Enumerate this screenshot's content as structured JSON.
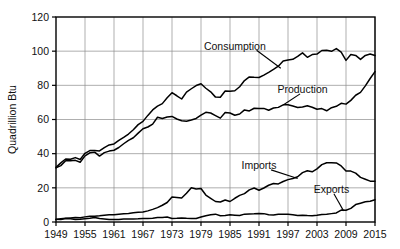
{
  "chart_data": {
    "type": "line",
    "title": "",
    "xlabel": "",
    "ylabel": "Quadrillion Btu",
    "xlim": [
      1949,
      2015
    ],
    "ylim": [
      0,
      120
    ],
    "grid": true,
    "legend_position": "inline-annotations",
    "xticks": [
      "1949",
      "1955",
      "1961",
      "1967",
      "1973",
      "1979",
      "1985",
      "1991",
      "1997",
      "2003",
      "2009",
      "2015"
    ],
    "yticks": [
      "0",
      "20",
      "40",
      "60",
      "80",
      "100",
      "120"
    ],
    "x": [
      1949,
      1950,
      1951,
      1952,
      1953,
      1954,
      1955,
      1956,
      1957,
      1958,
      1959,
      1960,
      1961,
      1962,
      1963,
      1964,
      1965,
      1966,
      1967,
      1968,
      1969,
      1970,
      1971,
      1972,
      1973,
      1974,
      1975,
      1976,
      1977,
      1978,
      1979,
      1980,
      1981,
      1982,
      1983,
      1984,
      1985,
      1986,
      1987,
      1988,
      1989,
      1990,
      1991,
      1992,
      1993,
      1994,
      1995,
      1996,
      1997,
      1998,
      1999,
      2000,
      2001,
      2002,
      2003,
      2004,
      2005,
      2006,
      2007,
      2008,
      2009,
      2010,
      2011,
      2012,
      2013,
      2014,
      2015
    ],
    "series": [
      {
        "name": "Consumption",
        "label": "Consumption",
        "values": [
          32.0,
          34.6,
          36.9,
          36.7,
          37.7,
          36.6,
          40.2,
          41.8,
          41.8,
          41.6,
          43.5,
          45.1,
          45.7,
          47.8,
          49.6,
          51.5,
          54.0,
          57.0,
          58.9,
          62.4,
          65.6,
          67.8,
          69.3,
          72.7,
          75.7,
          73.9,
          72.0,
          76.0,
          78.0,
          79.9,
          80.9,
          78.3,
          76.2,
          73.1,
          73.0,
          76.7,
          76.5,
          76.8,
          79.2,
          82.8,
          84.9,
          84.7,
          84.6,
          86.0,
          87.6,
          89.3,
          91.2,
          94.2,
          94.8,
          95.2,
          96.9,
          99.0,
          96.4,
          98.0,
          98.3,
          100.4,
          100.5,
          99.9,
          101.5,
          99.4,
          94.6,
          98.0,
          97.5,
          95.2,
          97.5,
          98.3,
          97.5
        ]
      },
      {
        "name": "Production",
        "label": "Production",
        "values": [
          31.7,
          33.0,
          35.8,
          35.9,
          36.1,
          35.0,
          38.7,
          40.5,
          40.9,
          38.6,
          40.6,
          41.5,
          42.0,
          43.6,
          45.8,
          47.8,
          49.3,
          52.0,
          54.6,
          55.6,
          57.3,
          61.3,
          60.6,
          61.5,
          61.8,
          60.3,
          59.3,
          59.0,
          59.7,
          60.6,
          62.6,
          64.2,
          63.8,
          62.3,
          60.8,
          64.1,
          63.8,
          62.5,
          63.2,
          65.6,
          65.0,
          66.6,
          66.5,
          66.5,
          65.4,
          66.7,
          67.1,
          68.6,
          68.6,
          67.9,
          67.0,
          67.3,
          68.0,
          67.2,
          66.0,
          66.4,
          65.1,
          66.9,
          67.7,
          69.5,
          69.0,
          71.2,
          74.2,
          75.9,
          79.7,
          84.0,
          88.0
        ]
      },
      {
        "name": "Imports",
        "label": "Imports",
        "values": [
          1.4,
          1.9,
          2.2,
          2.4,
          2.6,
          2.5,
          3.0,
          3.3,
          3.4,
          3.6,
          3.9,
          4.2,
          4.3,
          4.6,
          4.8,
          5.0,
          5.4,
          5.7,
          5.8,
          6.5,
          7.4,
          8.4,
          9.8,
          11.4,
          14.7,
          14.4,
          14.0,
          16.8,
          20.1,
          19.3,
          19.6,
          15.8,
          13.9,
          12.0,
          11.7,
          12.9,
          12.0,
          13.9,
          15.6,
          16.6,
          18.8,
          19.9,
          18.6,
          19.9,
          21.5,
          22.5,
          22.3,
          23.7,
          24.8,
          25.5,
          26.5,
          28.9,
          30.0,
          29.4,
          31.1,
          33.6,
          34.7,
          34.7,
          34.6,
          32.8,
          29.8,
          29.8,
          28.6,
          26.1,
          25.0,
          23.9,
          23.8
        ]
      },
      {
        "name": "Exports",
        "label": "Exports",
        "values": [
          1.6,
          1.5,
          2.0,
          1.9,
          1.5,
          1.6,
          1.9,
          2.2,
          2.6,
          2.0,
          1.8,
          1.5,
          1.5,
          1.5,
          1.8,
          1.8,
          1.8,
          1.9,
          2.1,
          2.1,
          2.2,
          2.6,
          2.7,
          2.9,
          2.1,
          2.2,
          2.4,
          2.2,
          2.1,
          2.0,
          2.9,
          3.7,
          4.3,
          4.6,
          3.7,
          3.8,
          4.2,
          4.0,
          3.8,
          4.6,
          4.7,
          4.8,
          5.0,
          4.9,
          4.3,
          4.1,
          4.5,
          4.6,
          4.5,
          4.3,
          3.8,
          4.0,
          3.8,
          3.7,
          4.0,
          4.4,
          4.5,
          4.9,
          5.3,
          7.0,
          6.9,
          8.0,
          10.2,
          11.0,
          11.8,
          12.2,
          13.0
        ]
      }
    ],
    "annotations": [
      {
        "text": "Consumption",
        "anchor_year": 1986,
        "anchor_value": 103
      },
      {
        "text": "Production",
        "anchor_year": 2000,
        "anchor_value": 78
      },
      {
        "text": "Imports",
        "anchor_year": 1991,
        "anchor_value": 33
      },
      {
        "text": "Exports",
        "anchor_year": 2006,
        "anchor_value": 19
      }
    ]
  }
}
